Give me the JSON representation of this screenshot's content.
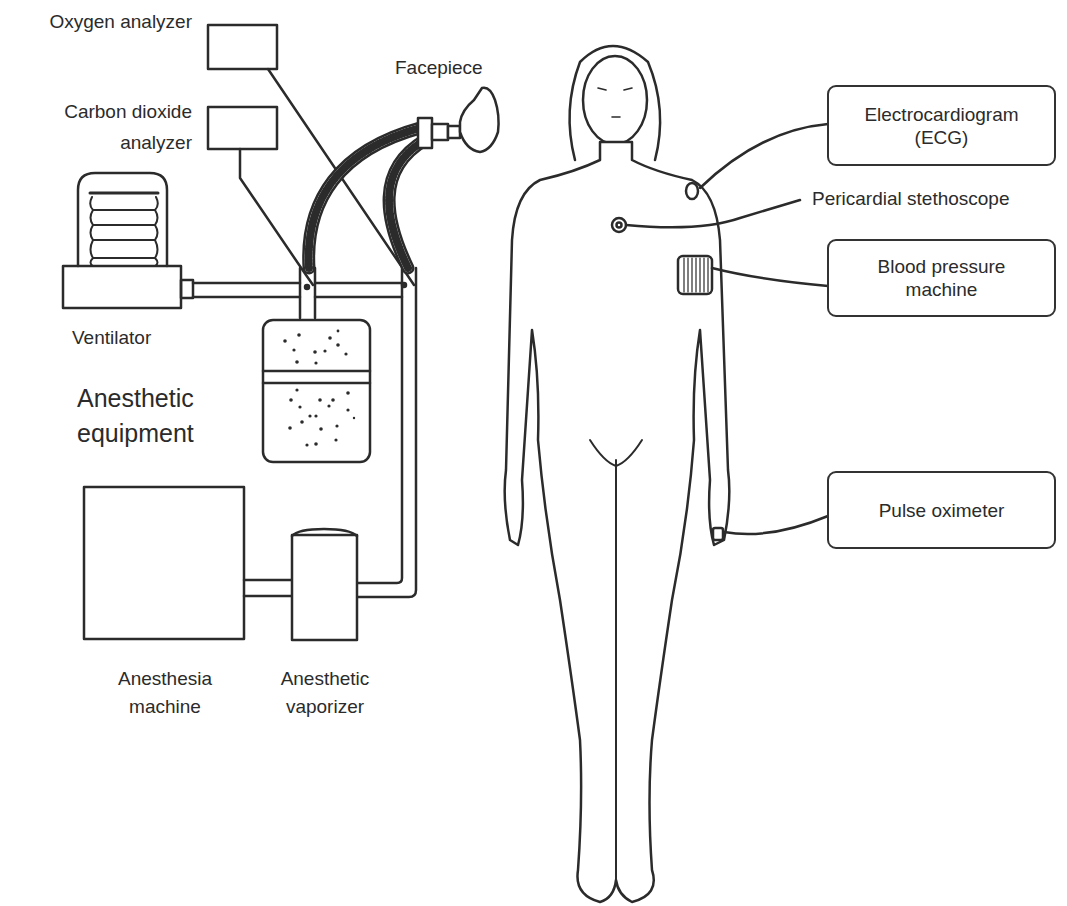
{
  "figure": {
    "domain": "Diagram",
    "ink_color": "#2b2b2b",
    "background": "#ffffff"
  },
  "equipment": {
    "group_label_line1": "Anesthetic",
    "group_label_line2": "equipment",
    "oxygen_analyzer": "Oxygen analyzer",
    "co2_analyzer_line1": "Carbon dioxide",
    "co2_analyzer_line2": "analyzer",
    "facepiece": "Facepiece",
    "ventilator": "Ventilator",
    "anesthesia_machine_line1": "Anesthesia",
    "anesthesia_machine_line2": "machine",
    "vaporizer_line1": "Anesthetic",
    "vaporizer_line2": "vaporizer"
  },
  "monitors": {
    "ecg_line1": "Electrocardiogram",
    "ecg_line2": "(ECG)",
    "stethoscope": "Pericardial stethoscope",
    "bp_line1": "Blood pressure",
    "bp_line2": "machine",
    "pulse_oximeter": "Pulse oximeter"
  }
}
